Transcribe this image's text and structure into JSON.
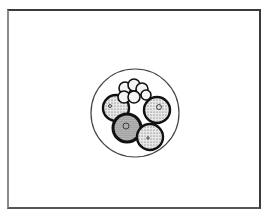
{
  "figure": {
    "frame": {
      "x": 7,
      "y": 9,
      "width": 254,
      "height": 200
    },
    "zona": {
      "cx": 135,
      "cy": 113,
      "r": 44,
      "stroke": "#444444"
    },
    "cells_large": [
      {
        "name": "upper-left-cell",
        "cx": 116,
        "cy": 108,
        "r": 13,
        "fill": "#d9d9d9"
      },
      {
        "name": "lower-left-cell",
        "cx": 127,
        "cy": 128,
        "r": 14,
        "fill": "#bdbdbd"
      },
      {
        "name": "right-cell",
        "cx": 157,
        "cy": 110,
        "r": 13,
        "fill": "#cfcfcf"
      },
      {
        "name": "bottom-right-cell",
        "cx": 150,
        "cy": 137,
        "r": 13,
        "fill": "#d3d3d3"
      }
    ],
    "cells_small": [
      {
        "cx": 125,
        "cy": 88,
        "r": 6
      },
      {
        "cx": 134,
        "cy": 85,
        "r": 6
      },
      {
        "cx": 142,
        "cy": 89,
        "r": 6
      },
      {
        "cx": 124,
        "cy": 97,
        "r": 6
      },
      {
        "cx": 134,
        "cy": 97,
        "r": 6
      },
      {
        "cx": 146,
        "cy": 95,
        "r": 5
      }
    ],
    "nuclei": [
      {
        "cx": 126,
        "cy": 126,
        "r": 3
      },
      {
        "cx": 159,
        "cy": 107,
        "r": 2.5
      },
      {
        "cx": 148,
        "cy": 138,
        "r": 1.2
      },
      {
        "cx": 110,
        "cy": 106,
        "r": 1.5
      }
    ]
  }
}
